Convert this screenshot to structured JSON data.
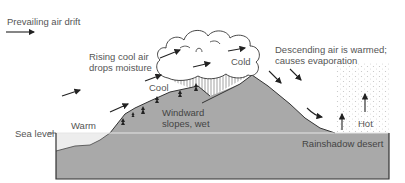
{
  "diagram": {
    "labels": {
      "prevailing": "Prevailing air drift",
      "rising_line1": "Rising cool air",
      "rising_line2": "drops moisture",
      "cool": "Cool",
      "cold": "Cold",
      "descending_line1": "Descending air is warmed;",
      "descending_line2": "causes evaporation",
      "warm": "Warm",
      "sea_level": "Sea level",
      "windward_line1": "Windward",
      "windward_line2": "slopes, wet",
      "hot": "Hot",
      "desert": "Rainshadow desert"
    },
    "colors": {
      "ground": "#a9a9a9",
      "water": "#ededed",
      "outline": "#333333",
      "sea_line": "#dcdcdc",
      "text": "#555555"
    }
  }
}
